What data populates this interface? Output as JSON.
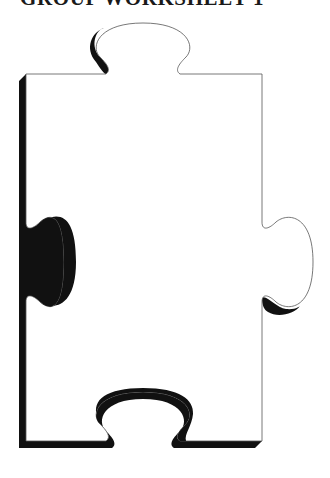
{
  "header": {
    "title": "GROUP WORKSHEET 1"
  },
  "puzzle": {
    "shape": "puzzle-piece",
    "fill": "#ffffff",
    "outline": "#555555",
    "shadow": "#111111"
  }
}
